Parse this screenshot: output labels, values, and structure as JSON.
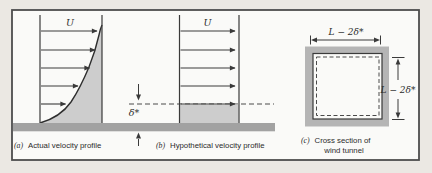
{
  "figure": {
    "panel_a": {
      "label": "(a)",
      "caption": "Actual velocity profile",
      "u_label": "U"
    },
    "panel_b": {
      "label": "(b)",
      "caption": "Hypothetical velocity profile",
      "u_label": "U",
      "displacement_label": "δ*"
    },
    "panel_c": {
      "label": "(c)",
      "caption_line1": "Cross section of",
      "caption_line2": "wind tunnel",
      "top_dim_label": "L − 2δ*",
      "side_dim_label": "L − 2δ*"
    }
  },
  "colors": {
    "page_bg": "#ebe8e3",
    "frame_bg": "#fafaf8",
    "frame_border": "#4d4d4d",
    "ground": "#a2a2a2",
    "shade": "#cdcdcd",
    "tunnel_wall": "#b5b5b5",
    "line": "#3a3a3a"
  }
}
